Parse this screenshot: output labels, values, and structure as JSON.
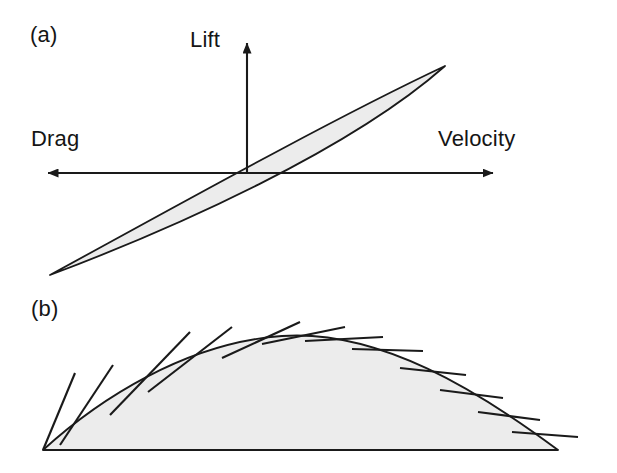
{
  "figure": {
    "background": "#ffffff",
    "stroke_color": "#1a1a1a",
    "fill_color": "#ececec",
    "panels": [
      {
        "id": "a",
        "tag": "(a)"
      },
      {
        "id": "b",
        "tag": "(b)"
      }
    ]
  },
  "panel_a": {
    "tag": "(a)",
    "axis_labels": {
      "vertical": "Lift",
      "left": "Drag",
      "right": "Velocity"
    },
    "axes": {
      "origin": [
        247,
        173
      ],
      "horizontal": {
        "x_start": 46,
        "x_end": 495,
        "y": 173
      },
      "vertical": {
        "x": 247,
        "y_start": 173,
        "y_end": 41
      },
      "arrowheads": [
        "left",
        "right",
        "up"
      ]
    },
    "airfoil": {
      "shape": "thin-lens",
      "tip_lower_left": [
        50,
        275
      ],
      "tip_upper_right": [
        445,
        66
      ],
      "upper_edge_control": [
        170,
        110
      ],
      "lower_edge_control": [
        330,
        232
      ],
      "fill": "#ececec",
      "stroke": "#1a1a1a"
    }
  },
  "panel_b": {
    "tag": "(b)",
    "dome": {
      "left_vertex": [
        43,
        450
      ],
      "right_vertex": [
        558,
        450
      ],
      "apex": [
        282,
        336
      ],
      "baseline_y": 450,
      "fill": "#ececec",
      "stroke": "#1a1a1a"
    },
    "tangent_vectors": [
      {
        "index": 1,
        "base": [
          43,
          450
        ],
        "tip": [
          75,
          373
        ]
      },
      {
        "index": 2,
        "base": [
          60,
          445
        ],
        "tip": [
          113,
          365
        ]
      },
      {
        "index": 3,
        "base": [
          110,
          415
        ],
        "tip": [
          190,
          332
        ]
      },
      {
        "index": 4,
        "base": [
          148,
          392
        ],
        "tip": [
          232,
          327
        ]
      },
      {
        "index": 5,
        "base": [
          222,
          358
        ],
        "tip": [
          300,
          322
        ]
      },
      {
        "index": 6,
        "base": [
          262,
          344
        ],
        "tip": [
          345,
          327
        ]
      },
      {
        "index": 7,
        "base": [
          305,
          341
        ],
        "tip": [
          383,
          337
        ]
      },
      {
        "index": 8,
        "base": [
          352,
          349
        ],
        "tip": [
          423,
          351
        ]
      },
      {
        "index": 9,
        "base": [
          400,
          368
        ],
        "tip": [
          466,
          375
        ]
      },
      {
        "index": 10,
        "base": [
          440,
          390
        ],
        "tip": [
          503,
          398
        ]
      },
      {
        "index": 11,
        "base": [
          478,
          412
        ],
        "tip": [
          540,
          420
        ]
      },
      {
        "index": 12,
        "base": [
          512,
          432
        ],
        "tip": [
          578,
          437
        ]
      }
    ]
  }
}
